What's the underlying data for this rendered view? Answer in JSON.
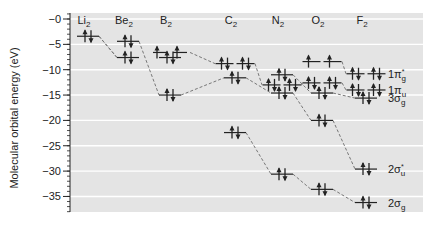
{
  "chart_data": {
    "type": "diagram",
    "title": "",
    "ylabel": "Molecular orbital energy (eV)",
    "ylim": [
      -38,
      1
    ],
    "yticks": [
      0,
      -5,
      -10,
      -15,
      -20,
      -25,
      -30,
      -35
    ],
    "ytick_labels": [
      "-0",
      "-5",
      "-10",
      "-15",
      "-20",
      "-25",
      "-30",
      "-35"
    ],
    "grid": true,
    "molecules": [
      {
        "name": "Li",
        "sub": "2",
        "x": 88,
        "levels": [
          {
            "orbital": "2σg",
            "energy": -3.4,
            "electrons": 2,
            "degeneracy": 1
          }
        ]
      },
      {
        "name": "Be",
        "sub": "2",
        "x": 128,
        "levels": [
          {
            "orbital": "2σu*",
            "energy": -4.4,
            "electrons": 2,
            "degeneracy": 1
          },
          {
            "orbital": "2σg",
            "energy": -7.6,
            "electrons": 2,
            "degeneracy": 1
          }
        ]
      },
      {
        "name": "B",
        "sub": "2",
        "x": 170,
        "levels": [
          {
            "orbital": "1πu",
            "energy": -6.6,
            "electrons": 2,
            "degeneracy": 2,
            "note": "two singly-occupied"
          },
          {
            "orbital": "3σg",
            "energy": -7.6,
            "electrons": 2,
            "degeneracy": 1
          },
          {
            "orbital": "2σu*",
            "energy": -15.0,
            "electrons": 2,
            "degeneracy": 1
          }
        ]
      },
      {
        "name": "C",
        "sub": "2",
        "x": 235,
        "levels": [
          {
            "orbital": "1πu",
            "energy": -8.8,
            "electrons": 4,
            "degeneracy": 2
          },
          {
            "orbital": "2σu*",
            "energy": -11.6,
            "electrons": 2,
            "degeneracy": 1
          },
          {
            "orbital": "2σg",
            "energy": -22.4,
            "electrons": 2,
            "degeneracy": 1
          }
        ]
      },
      {
        "name": "N",
        "sub": "2",
        "x": 282,
        "levels": [
          {
            "orbital": "3σg",
            "energy": -11.0,
            "electrons": 2,
            "degeneracy": 1
          },
          {
            "orbital": "1πu",
            "energy": -13.0,
            "electrons": 4,
            "degeneracy": 2
          },
          {
            "orbital": "2σu*",
            "energy": -14.6,
            "electrons": 2,
            "degeneracy": 1
          },
          {
            "orbital": "2σg",
            "energy": -30.6,
            "electrons": 2,
            "degeneracy": 1
          }
        ]
      },
      {
        "name": "O",
        "sub": "2",
        "x": 322,
        "levels": [
          {
            "orbital": "1πg*",
            "energy": -8.4,
            "electrons": 2,
            "degeneracy": 2
          },
          {
            "orbital": "1πu",
            "energy": -12.6,
            "electrons": 4,
            "degeneracy": 2
          },
          {
            "orbital": "3σg",
            "energy": -14.6,
            "electrons": 2,
            "degeneracy": 1
          },
          {
            "orbital": "2σu*",
            "energy": -20.0,
            "electrons": 2,
            "degeneracy": 1
          },
          {
            "orbital": "2σg",
            "energy": -33.6,
            "electrons": 2,
            "degeneracy": 1
          }
        ]
      },
      {
        "name": "F",
        "sub": "2",
        "x": 366,
        "levels": [
          {
            "orbital": "1πg*",
            "energy": -10.8,
            "electrons": 4,
            "degeneracy": 2
          },
          {
            "orbital": "1πu",
            "energy": -14.0,
            "electrons": 4,
            "degeneracy": 2
          },
          {
            "orbital": "3σg",
            "energy": -15.6,
            "electrons": 2,
            "degeneracy": 1
          },
          {
            "orbital": "2σu*",
            "energy": -29.6,
            "electrons": 2,
            "degeneracy": 1
          },
          {
            "orbital": "2σg",
            "energy": -36.2,
            "electrons": 2,
            "degeneracy": 1
          }
        ]
      }
    ],
    "orbital_labels": [
      {
        "main": "1π",
        "sub": "g",
        "sup": "*",
        "energy": -10.8
      },
      {
        "main": "1π",
        "sub": "u",
        "sup": "",
        "energy": -14.0
      },
      {
        "main": "3σ",
        "sub": "g",
        "sup": "",
        "energy": -15.6
      },
      {
        "main": "2σ",
        "sub": "u",
        "sup": "*",
        "energy": -29.6
      },
      {
        "main": "2σ",
        "sub": "g",
        "sup": "",
        "energy": -36.2
      }
    ]
  },
  "colors": {
    "plot_bg": "#e4e4e4",
    "grid": "#ffffff",
    "line": "#222222",
    "dash": "#777777"
  }
}
